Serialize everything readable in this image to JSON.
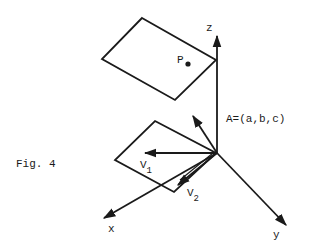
{
  "figure": {
    "caption": "Fig. 4",
    "colors": {
      "ink": "#1a1a1a",
      "background": "#ffffff"
    }
  },
  "axes": {
    "x_label": "x",
    "y_label": "y",
    "z_label": "z"
  },
  "labels": {
    "point": "P",
    "normal_vector": "A=(a,b,c)",
    "v1_main": "V",
    "v1_sub": "1",
    "v2_main": "V",
    "v2_sub": "2"
  }
}
